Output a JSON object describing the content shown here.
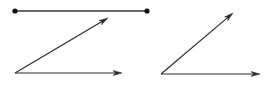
{
  "canvas": {
    "width": 266,
    "height": 85,
    "background": "#ffffff",
    "title": "Geometry figure: line segment and two angles"
  },
  "style": {
    "stroke_color": "#2b2b2b",
    "segment_stroke_color": "#3a3a3a",
    "stroke_width": 1.2,
    "segment_stroke_width": 1.6,
    "endpoint_dot_color": "#111111",
    "endpoint_dot_radius": 2.6,
    "arrowhead_length": 9,
    "arrowhead_width": 5
  },
  "figures": [
    {
      "name": "left-figure",
      "label": "Line segment above an angle",
      "elements": [
        {
          "name": "top-line-segment",
          "type": "segment",
          "x1": 15,
          "y1": 11,
          "x2": 147,
          "y2": 11,
          "endpoint_style": "dots",
          "arrow": "none"
        },
        {
          "name": "left-angle-upper-ray",
          "type": "ray",
          "x1": 15,
          "y1": 73,
          "x2": 108,
          "y2": 18,
          "arrow": "end"
        },
        {
          "name": "left-angle-lower-ray",
          "type": "ray",
          "x1": 15,
          "y1": 73,
          "x2": 122,
          "y2": 73,
          "arrow": "end"
        }
      ],
      "vertex": {
        "x": 15,
        "y": 73
      }
    },
    {
      "name": "right-figure",
      "label": "Angle with two rays",
      "elements": [
        {
          "name": "right-angle-upper-ray",
          "type": "ray",
          "x1": 161,
          "y1": 74,
          "x2": 233,
          "y2": 13,
          "arrow": "end"
        },
        {
          "name": "right-angle-lower-ray",
          "type": "ray",
          "x1": 161,
          "y1": 74,
          "x2": 260,
          "y2": 74,
          "arrow": "end"
        }
      ],
      "vertex": {
        "x": 161,
        "y": 74
      }
    }
  ]
}
